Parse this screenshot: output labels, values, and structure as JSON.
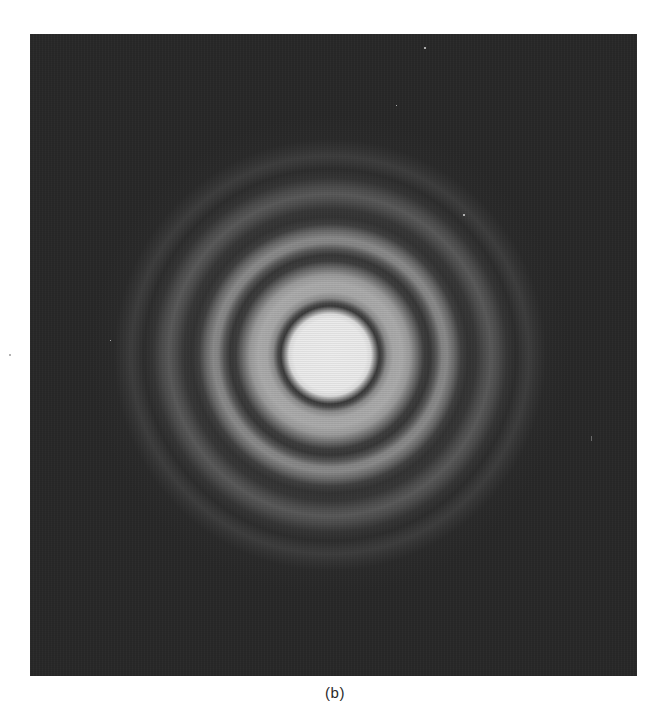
{
  "figure": {
    "caption": "(b)",
    "colors": {
      "page_background": "#ffffff",
      "plate_background": "#282828",
      "central_disk": "#ebebeb",
      "first_bright_ring": "#aaaaaa",
      "second_bright_ring": "#8a8a8a",
      "faint_outer_ring": "#595959",
      "caption_text": "#2a2a2a"
    },
    "pattern": {
      "center_px": [
        330,
        355
      ],
      "central_disk_radius_px": 42,
      "dark_ring_radii_px": [
        48,
        97,
        138,
        182
      ],
      "bright_ring_radii_px": [
        70,
        115,
        160,
        198
      ]
    }
  }
}
